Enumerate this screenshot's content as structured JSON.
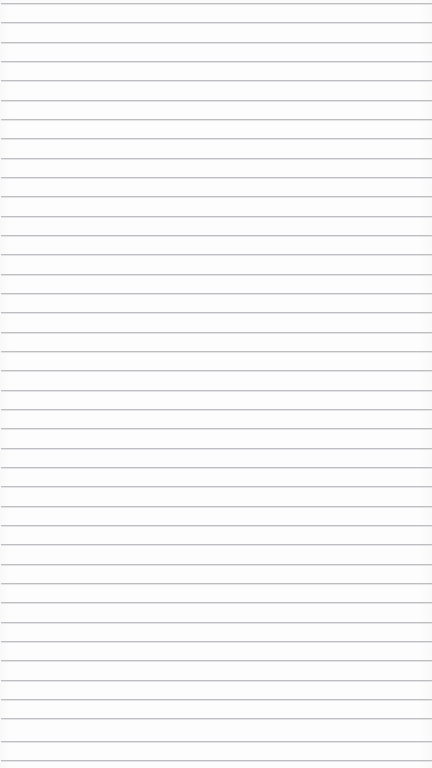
{
  "page": {
    "kind": "ruled-notebook-paper",
    "width": 432,
    "height": 768,
    "background_color": "#fdfdfd",
    "content_text": ""
  },
  "ruling": {
    "line_color": "#b9b9bd",
    "line_color_soft": "#e2e2e5",
    "line_thickness": 1,
    "line_spacing": 19.3,
    "first_line_y": 3,
    "line_count": 40,
    "left_inset": 1,
    "right_inset": 0
  },
  "lines": [
    {
      "index": 1,
      "y": 3
    },
    {
      "index": 2,
      "y": 22
    },
    {
      "index": 3,
      "y": 42
    },
    {
      "index": 4,
      "y": 61
    },
    {
      "index": 5,
      "y": 80
    },
    {
      "index": 6,
      "y": 100
    },
    {
      "index": 7,
      "y": 119
    },
    {
      "index": 8,
      "y": 138
    },
    {
      "index": 9,
      "y": 158
    },
    {
      "index": 10,
      "y": 177
    },
    {
      "index": 11,
      "y": 196
    },
    {
      "index": 12,
      "y": 216
    },
    {
      "index": 13,
      "y": 235
    },
    {
      "index": 14,
      "y": 254
    },
    {
      "index": 15,
      "y": 274
    },
    {
      "index": 16,
      "y": 293
    },
    {
      "index": 17,
      "y": 312
    },
    {
      "index": 18,
      "y": 332
    },
    {
      "index": 19,
      "y": 351
    },
    {
      "index": 20,
      "y": 370
    },
    {
      "index": 21,
      "y": 390
    },
    {
      "index": 22,
      "y": 409
    },
    {
      "index": 23,
      "y": 428
    },
    {
      "index": 24,
      "y": 448
    },
    {
      "index": 25,
      "y": 467
    },
    {
      "index": 26,
      "y": 486
    },
    {
      "index": 27,
      "y": 506
    },
    {
      "index": 28,
      "y": 525
    },
    {
      "index": 29,
      "y": 544
    },
    {
      "index": 30,
      "y": 564
    },
    {
      "index": 31,
      "y": 583
    },
    {
      "index": 32,
      "y": 602
    },
    {
      "index": 33,
      "y": 622
    },
    {
      "index": 34,
      "y": 641
    },
    {
      "index": 35,
      "y": 660
    },
    {
      "index": 36,
      "y": 680
    },
    {
      "index": 37,
      "y": 699
    },
    {
      "index": 38,
      "y": 718
    },
    {
      "index": 39,
      "y": 741
    },
    {
      "index": 40,
      "y": 760
    }
  ]
}
